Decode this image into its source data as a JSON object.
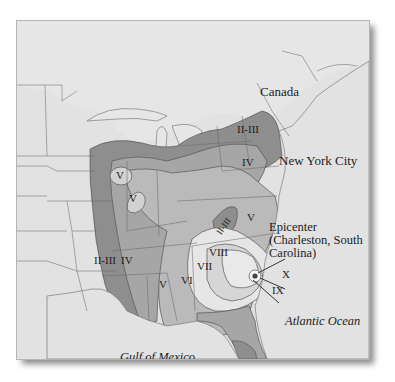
{
  "map": {
    "title": "1886 Charleston earthquake intensity map",
    "colors": {
      "background": "#e2e2e2",
      "border_lines": "#6a6a6a",
      "zone_II_III": "#8e8e8e",
      "zone_IV": "#a6a6a6",
      "zone_V": "#bababa",
      "zone_VI": "#c9c9c9",
      "zone_VII": "#d6d6d6",
      "zone_VIII": "#e8e8e8",
      "zone_IX_X": "#f4f4f4",
      "florida_dark": "#8e8e8e"
    },
    "place_labels": {
      "canada": "Canada",
      "new_york_city": "New York City",
      "atlantic_ocean": "Atlantic Ocean",
      "gulf_of_mexico": "Gulf of Mexico"
    },
    "epicenter": {
      "label": "Epicenter\n(Charleston, South\nCarolina)"
    },
    "intensity_zones": [
      {
        "id": "ii-iii-northeast",
        "label": "II-III"
      },
      {
        "id": "iv-northeast",
        "label": "IV"
      },
      {
        "id": "v-illinois-north",
        "label": "V"
      },
      {
        "id": "v-illinois-south",
        "label": "V"
      },
      {
        "id": "ii-iii-appalachian",
        "label": "II-III"
      },
      {
        "id": "v-virginia",
        "label": "V"
      },
      {
        "id": "ii-iii-west",
        "label": "II-III"
      },
      {
        "id": "iv-west",
        "label": "IV"
      },
      {
        "id": "v-south",
        "label": "V"
      },
      {
        "id": "vi",
        "label": "VI"
      },
      {
        "id": "vii",
        "label": "VII"
      },
      {
        "id": "viii",
        "label": "VIII"
      },
      {
        "id": "x",
        "label": "X"
      },
      {
        "id": "ix",
        "label": "IX"
      }
    ]
  }
}
